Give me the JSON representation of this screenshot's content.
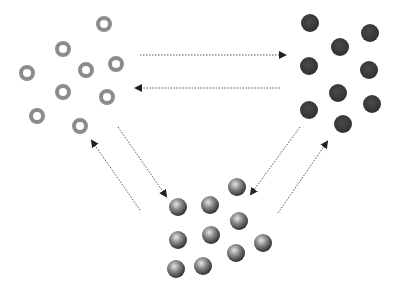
{
  "diagram": {
    "colors": {
      "ring": "#8c8c8c",
      "dark": "#3a3a3a",
      "sphere_light": "#d0d0d0",
      "sphere_dark": "#3c3c3c",
      "arrow": "#555555"
    },
    "groups": {
      "rings": {
        "label": "",
        "radius": 8,
        "items": [
          [
            104,
            24
          ],
          [
            63,
            49
          ],
          [
            86,
            70
          ],
          [
            116,
            64
          ],
          [
            27,
            73
          ],
          [
            63,
            92
          ],
          [
            107,
            97
          ],
          [
            37,
            116
          ],
          [
            80,
            126
          ]
        ]
      },
      "dark": {
        "label": "",
        "radius": 9,
        "items": [
          [
            310,
            23
          ],
          [
            370,
            33
          ],
          [
            340,
            47
          ],
          [
            309,
            66
          ],
          [
            369,
            70
          ],
          [
            338,
            93
          ],
          [
            372,
            104
          ],
          [
            309,
            110
          ],
          [
            343,
            124
          ]
        ]
      },
      "spheres": {
        "label": "",
        "radius": 9,
        "items": [
          [
            178,
            207
          ],
          [
            210,
            205
          ],
          [
            237,
            187
          ],
          [
            239,
            221
          ],
          [
            178,
            240
          ],
          [
            211,
            235
          ],
          [
            263,
            243
          ],
          [
            236,
            253
          ],
          [
            176,
            269
          ],
          [
            203,
            266
          ]
        ]
      }
    },
    "arrows": [
      {
        "from": [
          140,
          55
        ],
        "to": [
          285,
          55
        ],
        "name": "rings-to-dark"
      },
      {
        "from": [
          280,
          88
        ],
        "to": [
          136,
          88
        ],
        "name": "dark-to-rings"
      },
      {
        "from": [
          118,
          127
        ],
        "to": [
          166,
          196
        ],
        "name": "rings-to-spheres"
      },
      {
        "from": [
          140,
          210
        ],
        "to": [
          92,
          141
        ],
        "name": "spheres-to-rings"
      },
      {
        "from": [
          300,
          127
        ],
        "to": [
          251,
          194
        ],
        "name": "dark-to-spheres"
      },
      {
        "from": [
          278,
          213
        ],
        "to": [
          327,
          142
        ],
        "name": "spheres-to-dark"
      }
    ]
  }
}
